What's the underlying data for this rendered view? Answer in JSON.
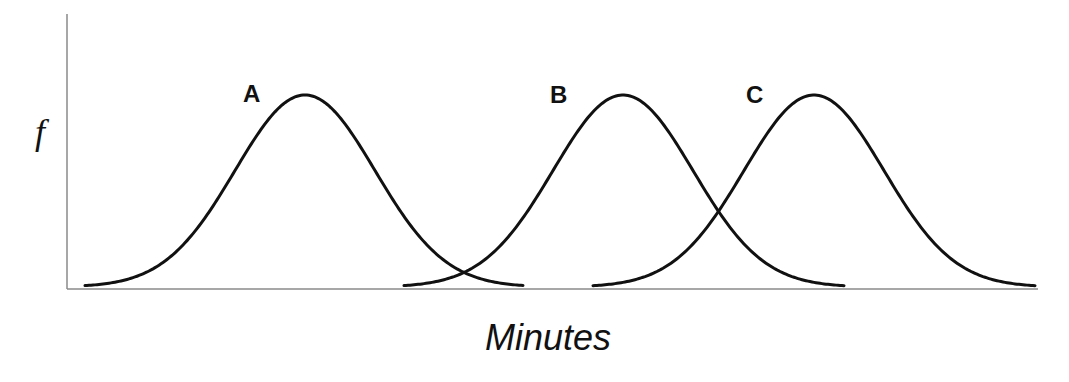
{
  "chart_data": {
    "type": "line",
    "title": "",
    "xlabel": "Minutes",
    "ylabel": "f",
    "grid": false,
    "legend": "inline labels above curves",
    "x_ticks": [],
    "y_ticks": [],
    "series": [
      {
        "name": "A",
        "shape": "normal distribution",
        "center_px": 305,
        "sigma_px": 70,
        "start_px": 85,
        "end_px": 523,
        "peak_rel": 1.0
      },
      {
        "name": "B",
        "shape": "normal distribution",
        "center_px": 623,
        "sigma_px": 70,
        "start_px": 404,
        "end_px": 845,
        "peak_rel": 1.0
      },
      {
        "name": "C",
        "shape": "normal distribution",
        "center_px": 814,
        "sigma_px": 70,
        "start_px": 593,
        "end_px": 1035,
        "peak_rel": 1.0
      }
    ],
    "annotations": [
      {
        "text": "A",
        "x_px": 243,
        "y_px": 102
      },
      {
        "text": "B",
        "x_px": 550,
        "y_px": 103
      },
      {
        "text": "C",
        "x_px": 746,
        "y_px": 103
      }
    ]
  },
  "layout": {
    "plot": {
      "x0": 67,
      "y_top": 14,
      "y_base": 289,
      "x_end": 1038
    },
    "curve_base_y": 287,
    "peak_y": 95,
    "colors": {
      "curve": "#111111",
      "axis": "#8a8a8a",
      "background": "#ffffff"
    }
  }
}
